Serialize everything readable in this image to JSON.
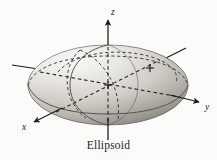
{
  "figure": {
    "caption": "Ellipsoid",
    "type": "3d-quadric-surface-diagram",
    "background_color": "#fbfbfa",
    "surface_color_light": "#eceae6",
    "surface_color_mid": "#c9c6c0",
    "surface_color_dark": "#a09d97",
    "line_color": "#3a3733",
    "axis_color": "#1d1b18"
  },
  "axes": [
    {
      "name": "z-axis",
      "label": "z",
      "direction": "up",
      "label_x": 111,
      "label_y": 13,
      "arrow": true
    },
    {
      "name": "y-axis",
      "label": "y",
      "direction": "right",
      "label_x": 206,
      "label_y": 108,
      "arrow": true
    },
    {
      "name": "x-axis",
      "label": "x",
      "direction": "lower-left",
      "label_x": 25,
      "label_y": 128,
      "arrow": true
    },
    {
      "name": "y-axis-negative",
      "label": "",
      "direction": "left",
      "arrow": true
    },
    {
      "name": "x-axis-negative",
      "label": "",
      "direction": "upper-right",
      "arrow": false
    }
  ],
  "surface": {
    "center": {
      "x": 108,
      "y": 85
    },
    "semi_axis_a": 80,
    "semi_axis_b": 40,
    "shading": "gradient-upper-left-light",
    "contours": [
      {
        "name": "equator-ellipse",
        "visible": "front-solid-back-dashed"
      },
      {
        "name": "xz-trace-ellipse",
        "visible": "front-solid-back-dashed"
      },
      {
        "name": "yz-trace-ellipse",
        "visible": "dashed"
      }
    ]
  }
}
